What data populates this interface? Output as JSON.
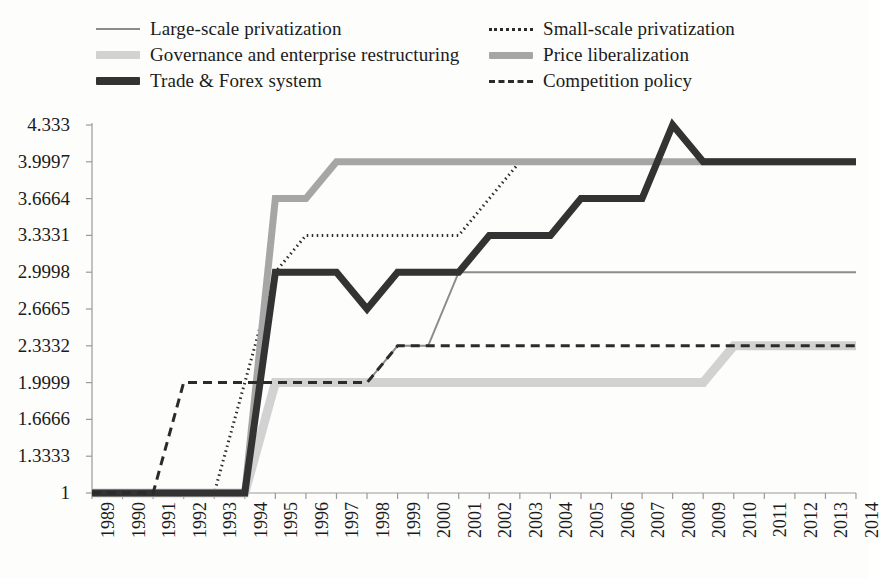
{
  "chart_data": {
    "type": "line",
    "title": "",
    "xlabel": "",
    "ylabel": "",
    "grid": false,
    "legend_position": "top",
    "x": [
      1989,
      1990,
      1991,
      1992,
      1993,
      1994,
      1995,
      1996,
      1997,
      1998,
      1999,
      2000,
      2001,
      2002,
      2003,
      2004,
      2005,
      2006,
      2007,
      2008,
      2009,
      2010,
      2011,
      2012,
      2013,
      2014
    ],
    "xtick_labels": [
      "1989",
      "1990",
      "1991",
      "1992",
      "1993",
      "1994",
      "1995",
      "1996",
      "1997",
      "1998",
      "1999",
      "2000",
      "2001",
      "2002",
      "2003",
      "2004",
      "2005",
      "2006",
      "2007",
      "2008",
      "2009",
      "2010",
      "2011",
      "2012",
      "2013",
      "2014"
    ],
    "ytick_labels": [
      "4.333",
      "3.9997",
      "3.6664",
      "3.3331",
      "2.9998",
      "2.6665",
      "2.3332",
      "1.9999",
      "1.6666",
      "1.3333",
      "1"
    ],
    "ytick_values": [
      4.333,
      3.9997,
      3.6664,
      3.3331,
      2.9998,
      2.6665,
      2.3332,
      1.9999,
      1.6666,
      1.3333,
      1
    ],
    "ylim": [
      1,
      4.333
    ],
    "xlim": [
      1989,
      2014
    ],
    "series": [
      {
        "name": "Large-scale privatization",
        "color": "#8c8c8c",
        "style": "solid",
        "width": 2,
        "values": [
          1,
          1,
          1,
          1,
          1,
          1,
          1.9999,
          1.9999,
          1.9999,
          1.9999,
          2.3332,
          2.3332,
          2.9998,
          2.9998,
          2.9998,
          2.9998,
          2.9998,
          2.9998,
          2.9998,
          2.9998,
          2.9998,
          2.9998,
          2.9998,
          2.9998,
          2.9998,
          2.9998
        ]
      },
      {
        "name": "Small-scale privatization",
        "color": "#2b2b2b",
        "style": "dotted",
        "width": 3,
        "values": [
          1,
          1,
          1,
          1,
          1,
          1.9999,
          2.9998,
          3.3331,
          3.3331,
          3.3331,
          3.3331,
          3.3331,
          3.3331,
          3.6664,
          3.9997,
          3.9997,
          3.9997,
          3.9997,
          3.9997,
          3.9997,
          3.9997,
          3.9997,
          3.9997,
          3.9997,
          3.9997,
          3.9997
        ]
      },
      {
        "name": "Governance and enterprise restructuring",
        "color": "#d2d2d2",
        "style": "solid",
        "width": 9,
        "values": [
          1,
          1,
          1,
          1,
          1,
          1,
          1.9999,
          1.9999,
          1.9999,
          1.9999,
          1.9999,
          1.9999,
          1.9999,
          1.9999,
          1.9999,
          1.9999,
          1.9999,
          1.9999,
          1.9999,
          1.9999,
          1.9999,
          2.3332,
          2.3332,
          2.3332,
          2.3332,
          2.3332
        ]
      },
      {
        "name": "Price liberalization",
        "color": "#a6a6a6",
        "style": "solid",
        "width": 7,
        "values": [
          1,
          1,
          1,
          1,
          1,
          1,
          3.6664,
          3.6664,
          3.9997,
          3.9997,
          3.9997,
          3.9997,
          3.9997,
          3.9997,
          3.9997,
          3.9997,
          3.9997,
          3.9997,
          3.9997,
          3.9997,
          3.9997,
          3.9997,
          3.9997,
          3.9997,
          3.9997,
          3.9997
        ]
      },
      {
        "name": "Trade & Forex system",
        "color": "#333333",
        "style": "solid",
        "width": 7,
        "values": [
          1,
          1,
          1,
          1,
          1,
          1,
          2.9998,
          2.9998,
          2.9998,
          2.6665,
          2.9998,
          2.9998,
          2.9998,
          3.3331,
          3.3331,
          3.3331,
          3.6664,
          3.6664,
          3.6664,
          4.333,
          3.9997,
          3.9997,
          3.9997,
          3.9997,
          3.9997,
          3.9997
        ]
      },
      {
        "name": "Competition policy",
        "color": "#2b2b2b",
        "style": "dashed",
        "width": 3,
        "values": [
          1,
          1,
          1,
          1.9999,
          1.9999,
          1.9999,
          1.9999,
          1.9999,
          1.9999,
          1.9999,
          2.3332,
          2.3332,
          2.3332,
          2.3332,
          2.3332,
          2.3332,
          2.3332,
          2.3332,
          2.3332,
          2.3332,
          2.3332,
          2.3332,
          2.3332,
          2.3332,
          2.3332,
          2.3332
        ]
      }
    ]
  },
  "legend": {
    "items": [
      {
        "label": "Large-scale privatization",
        "swatch": "line-solid-thin-gray-icon",
        "column": "left",
        "row": 0,
        "key": "large"
      },
      {
        "label": "Governance and enterprise restructuring",
        "swatch": "line-solid-thick-lightgray-icon",
        "column": "left",
        "row": 1,
        "key": "gov"
      },
      {
        "label": "Trade & Forex system",
        "swatch": "line-solid-thick-dark-icon",
        "column": "left",
        "row": 2,
        "key": "trade"
      },
      {
        "label": "Small-scale privatization",
        "swatch": "line-dotted-dark-icon",
        "column": "right",
        "row": 0,
        "key": "small"
      },
      {
        "label": "Price liberalization",
        "swatch": "line-solid-thick-gray-icon",
        "column": "right",
        "row": 1,
        "key": "price"
      },
      {
        "label": "Competition policy",
        "swatch": "line-dashed-dark-icon",
        "column": "right",
        "row": 2,
        "key": "comp"
      }
    ]
  },
  "colors": {
    "axis": "#9a9a9a",
    "text": "#1b1b1b",
    "background": "#fdfdfc"
  }
}
